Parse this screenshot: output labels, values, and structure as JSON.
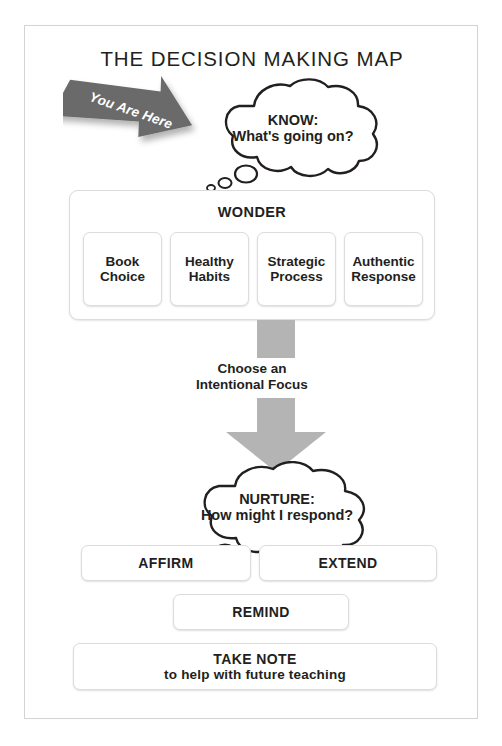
{
  "title": "THE DECISION MAKING MAP",
  "annotation": {
    "you_are_here_label": "You Are Here",
    "arrow_color": "#6b6b6b"
  },
  "know_cloud": {
    "heading": "KNOW:",
    "question": "What's going on?"
  },
  "wonder": {
    "title": "WONDER",
    "cells": [
      {
        "label": "Book\nChoice"
      },
      {
        "label": "Healthy\nHabits"
      },
      {
        "label": "Strategic\nProcess"
      },
      {
        "label": "Authentic\nResponse"
      }
    ]
  },
  "transition": {
    "label": "Choose an\nIntentional Focus",
    "arrow_color": "#b4b4b4"
  },
  "nurture_cloud": {
    "heading": "NURTURE:",
    "question": "How might I respond?"
  },
  "actions": {
    "affirm": "AFFIRM",
    "extend": "EXTEND",
    "remind": "REMIND",
    "take_note_main": "TAKE NOTE",
    "take_note_sub": "to help with future teaching"
  },
  "colors": {
    "text": "#231f20",
    "frame_border": "#d3d3d3",
    "box_border": "#dcdcdc",
    "background": "#ffffff"
  }
}
